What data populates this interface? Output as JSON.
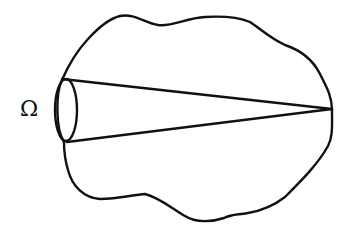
{
  "diagram": {
    "type": "solid-angle-cone",
    "label": "Ω",
    "stroke_color": "#111111",
    "background_color": "#ffffff",
    "elements": {
      "boundary": "irregular closed region",
      "aperture": "ellipse (cone base)",
      "cone_lines": [
        "upper generator",
        "lower generator"
      ],
      "apex": "vertex on right boundary"
    }
  }
}
